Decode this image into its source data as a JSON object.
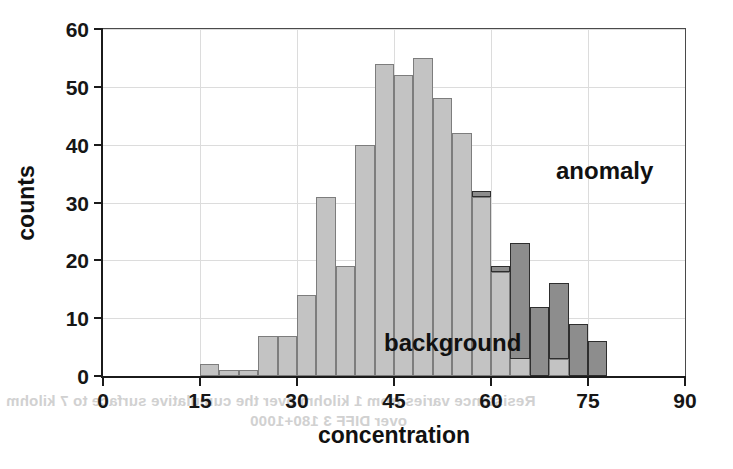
{
  "chart_data": {
    "type": "bar",
    "title": "",
    "subtitle": "",
    "xlabel": "concentration",
    "ylabel": "counts",
    "xlim": [
      0,
      90
    ],
    "ylim": [
      0,
      60
    ],
    "xticks": [
      0,
      15,
      30,
      45,
      60,
      75,
      90
    ],
    "yticks": [
      0,
      10,
      20,
      30,
      40,
      50,
      60
    ],
    "xtick_labels": [
      "0",
      "15",
      "30",
      "45",
      "60",
      "75",
      "90"
    ],
    "ytick_labels": [
      "0",
      "10",
      "20",
      "30",
      "40",
      "50",
      "60"
    ],
    "grid": true,
    "grid_color": "#dcdcdc",
    "legend_position": "in-plot-annotations",
    "bin_width": 3,
    "bin_starts": [
      15,
      18,
      21,
      24,
      27,
      30,
      33,
      36,
      39,
      42,
      45,
      48,
      51,
      54,
      57,
      60,
      63,
      66,
      69,
      72,
      75
    ],
    "bin_centers": [
      16.5,
      19.5,
      22.5,
      25.5,
      28.5,
      31.5,
      34.5,
      37.5,
      40.5,
      43.5,
      46.5,
      49.5,
      52.5,
      55.5,
      58.5,
      61.5,
      64.5,
      67.5,
      70.5,
      73.5,
      76.5
    ],
    "series": [
      {
        "name": "background",
        "color": "#c3c3c3",
        "edge_color": "#7d7d7d",
        "values": [
          2,
          1,
          1,
          7,
          7,
          14,
          31,
          19,
          40,
          54,
          52,
          55,
          48,
          42,
          31,
          18,
          15,
          3,
          3,
          0,
          0
        ]
      },
      {
        "name": "anomaly",
        "color": "#8d8d8d",
        "edge_color": "#2e2e2e",
        "values": [
          0,
          0,
          0,
          0,
          0,
          0,
          0,
          0,
          0,
          0,
          0,
          0,
          0,
          0,
          32,
          19,
          23,
          12,
          16,
          9,
          6
        ]
      }
    ],
    "annotations": [
      {
        "text": "anomaly",
        "x": 60,
        "y": 44
      },
      {
        "text": "background",
        "x": 31,
        "y": 14
      }
    ],
    "bars_light": [
      {
        "x0": 15,
        "x1": 18,
        "h": 2
      },
      {
        "x0": 18,
        "x1": 21,
        "h": 1
      },
      {
        "x0": 21,
        "x1": 24,
        "h": 1
      },
      {
        "x0": 24,
        "x1": 27,
        "h": 7
      },
      {
        "x0": 27,
        "x1": 30,
        "h": 7
      },
      {
        "x0": 30,
        "x1": 33,
        "h": 14
      },
      {
        "x0": 33,
        "x1": 36,
        "h": 31
      },
      {
        "x0": 36,
        "x1": 39,
        "h": 19
      },
      {
        "x0": 39,
        "x1": 42,
        "h": 40
      },
      {
        "x0": 42,
        "x1": 45,
        "h": 54
      },
      {
        "x0": 45,
        "x1": 48,
        "h": 52
      },
      {
        "x0": 48,
        "x1": 51,
        "h": 55
      },
      {
        "x0": 51,
        "x1": 54,
        "h": 48
      },
      {
        "x0": 54,
        "x1": 57,
        "h": 42
      },
      {
        "x0": 57,
        "x1": 60,
        "h": 31
      },
      {
        "x0": 60,
        "x1": 63,
        "h": 18
      },
      {
        "x0": 63,
        "x1": 66,
        "h": 15
      },
      {
        "x0": 66,
        "x1": 69,
        "h": 3
      },
      {
        "x0": 69,
        "x1": 72,
        "h": 3
      }
    ],
    "bars_dark": [
      {
        "x0": 57,
        "x1": 60,
        "h": 32,
        "base": 31
      },
      {
        "x0": 60,
        "x1": 63,
        "h": 19,
        "base": 18
      },
      {
        "x0": 63,
        "x1": 66,
        "h": 23,
        "base": 3
      },
      {
        "x0": 66,
        "x1": 69,
        "h": 12,
        "base": 0
      },
      {
        "x0": 69,
        "x1": 72,
        "h": 16,
        "base": 3
      },
      {
        "x0": 72,
        "x1": 75,
        "h": 9,
        "base": 0
      },
      {
        "x0": 75,
        "x1": 78,
        "h": 6,
        "base": 0
      }
    ]
  },
  "labels": {
    "ylabel": "counts",
    "xlabel": "concentration",
    "annot_anomaly": "anomaly",
    "annot_background": "background"
  },
  "bleed_through": {
    "line1": "Resistance varies from 1 kilohm over the cumulative surface to 7 kilohm",
    "line2": "over DIFF 3 180+1000"
  }
}
